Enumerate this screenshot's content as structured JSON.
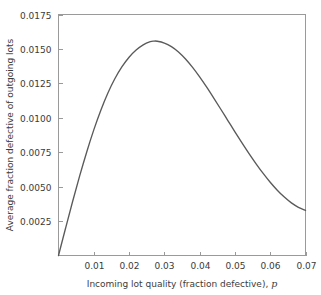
{
  "chart_data": {
    "type": "line",
    "title": "",
    "xlabel": "Incoming lot quality (fraction defective), p",
    "xlabel_text": "Incoming lot quality (fraction defective), ",
    "xlabel_symbol": "p",
    "ylabel": "Average fraction defective of outgoing lots",
    "xlim": [
      0.0,
      0.07
    ],
    "ylim": [
      0.0,
      0.0175
    ],
    "grid": false,
    "legend": "none",
    "xticks": [
      0.01,
      0.02,
      0.03,
      0.04,
      0.05,
      0.06,
      0.07
    ],
    "xtick_labels": [
      "0.01",
      "0.02",
      "0.03",
      "0.04",
      "0.05",
      "0.06",
      "0.07"
    ],
    "yticks": [
      0.0025,
      0.005,
      0.0075,
      0.01,
      0.0125,
      0.015,
      0.0175
    ],
    "ytick_labels": [
      "0.0025",
      "0.0050",
      "0.0075",
      "0.0100",
      "0.0125",
      "0.0150",
      "0.0175"
    ],
    "series": [
      {
        "name": "AOQ curve",
        "color": "#5a5a5a",
        "x": [
          0.0,
          0.002,
          0.004,
          0.006,
          0.008,
          0.01,
          0.012,
          0.014,
          0.016,
          0.018,
          0.02,
          0.022,
          0.024,
          0.026,
          0.027,
          0.028,
          0.03,
          0.032,
          0.034,
          0.036,
          0.038,
          0.04,
          0.042,
          0.044,
          0.046,
          0.048,
          0.05,
          0.052,
          0.054,
          0.056,
          0.058,
          0.06,
          0.062,
          0.064,
          0.066,
          0.068,
          0.07
        ],
        "y": [
          0.0,
          0.00198,
          0.00392,
          0.00578,
          0.00752,
          0.00912,
          0.01055,
          0.0118,
          0.01285,
          0.01371,
          0.0144,
          0.01492,
          0.0153,
          0.01553,
          0.01557,
          0.01556,
          0.01543,
          0.01517,
          0.01478,
          0.01427,
          0.01366,
          0.01297,
          0.01222,
          0.01143,
          0.01062,
          0.0098,
          0.00898,
          0.00818,
          0.0074,
          0.00666,
          0.00596,
          0.00532,
          0.00474,
          0.00424,
          0.00382,
          0.0035,
          0.00327
        ]
      }
    ],
    "annotations": {
      "peak_x": 0.027,
      "peak_y": 0.01557
    }
  },
  "axis_titles": {
    "y": "Average fraction defective of outgoing lots"
  }
}
